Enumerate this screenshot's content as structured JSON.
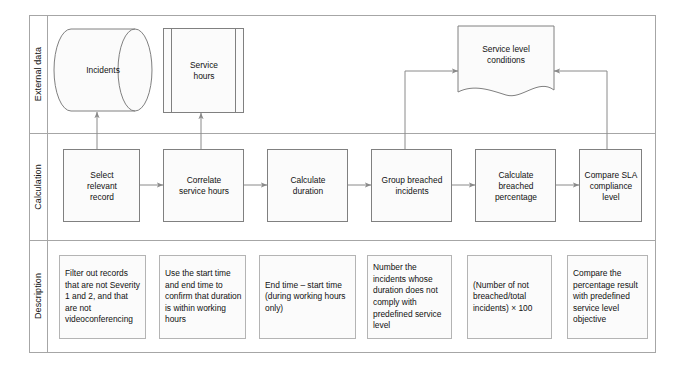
{
  "diagram": {
    "type": "swimlane-flowchart",
    "colors": {
      "border": "#a6a6a6",
      "node_fill": "#fbfbfb",
      "node_stroke": "#808080",
      "connector": "#808080",
      "text": "#111111",
      "background": "#ffffff"
    },
    "lanes": [
      {
        "id": "external-data",
        "label": "External data"
      },
      {
        "id": "calculation",
        "label": "Calculation"
      },
      {
        "id": "description",
        "label": "Description"
      }
    ],
    "external_data_nodes": [
      {
        "id": "incidents",
        "shape": "cylinder",
        "label": "Incidents"
      },
      {
        "id": "service-hours",
        "shape": "predefined-process",
        "label": "Service\nhours"
      },
      {
        "id": "service-level-conditions",
        "shape": "document",
        "label": "Service level\nconditions"
      }
    ],
    "calculation_nodes": [
      {
        "id": "select-relevant-record",
        "shape": "process",
        "label": "Select\nrelevant\nrecord"
      },
      {
        "id": "correlate-service-hours",
        "shape": "process",
        "label": "Correlate\nservice hours"
      },
      {
        "id": "calculate-duration",
        "shape": "process",
        "label": "Calculate\nduration"
      },
      {
        "id": "group-breached-incidents",
        "shape": "process",
        "label": "Group breached\nincidents"
      },
      {
        "id": "calculate-breached-percentage",
        "shape": "process",
        "label": "Calculate\nbreached\npercentage"
      },
      {
        "id": "compare-sla-compliance-level",
        "shape": "process",
        "label": "Compare SLA\ncompliance\nlevel"
      }
    ],
    "description_nodes": [
      {
        "id": "desc-select-relevant-record",
        "label": "Filter out records that are not Severity 1 and 2, and that are not videoconferencing"
      },
      {
        "id": "desc-correlate-service-hours",
        "label": "Use the start time and end time to confirm that duration is within working hours"
      },
      {
        "id": "desc-calculate-duration",
        "label": "End time – start time (during working hours only)"
      },
      {
        "id": "desc-group-breached-incidents",
        "label": "Number the incidents whose duration does not comply with predefined service level"
      },
      {
        "id": "desc-calculate-breached-percentage",
        "label": "(Number of not breached/total incidents) × 100"
      },
      {
        "id": "desc-compare-sla-compliance-level",
        "label": "Compare the percentage result with predefined service level objective"
      }
    ],
    "connectors": [
      {
        "id": "select-to-incidents",
        "from": "select-relevant-record",
        "to": "incidents",
        "direction": "up"
      },
      {
        "id": "correlate-to-service-hours",
        "from": "correlate-service-hours",
        "to": "service-hours",
        "direction": "up"
      },
      {
        "id": "select-to-correlate",
        "from": "select-relevant-record",
        "to": "correlate-service-hours",
        "direction": "right"
      },
      {
        "id": "correlate-to-calculate-duration",
        "from": "correlate-service-hours",
        "to": "calculate-duration",
        "direction": "right"
      },
      {
        "id": "calculate-duration-to-group",
        "from": "calculate-duration",
        "to": "group-breached-incidents",
        "direction": "right"
      },
      {
        "id": "group-to-calculate-percentage",
        "from": "group-breached-incidents",
        "to": "calculate-breached-percentage",
        "direction": "right"
      },
      {
        "id": "calculate-percentage-to-compare",
        "from": "calculate-breached-percentage",
        "to": "compare-sla-compliance-level",
        "direction": "right"
      },
      {
        "id": "group-to-conditions",
        "from": "group-breached-incidents",
        "to": "service-level-conditions",
        "direction": "elbow-up-right"
      },
      {
        "id": "compare-to-conditions",
        "from": "compare-sla-compliance-level",
        "to": "service-level-conditions",
        "direction": "elbow-up-left"
      }
    ]
  }
}
